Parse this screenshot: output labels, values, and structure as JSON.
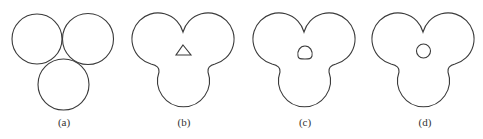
{
  "figure": {
    "stroke_color": "#3a3a3a",
    "background": "#ffffff",
    "panels": [
      {
        "id": "a",
        "label": "(a)",
        "label_x": 64,
        "description": "three separate tangent circles",
        "hole": "none"
      },
      {
        "id": "b",
        "label": "(b)",
        "label_x": 184,
        "description": "merged trefoil outline with triangular hole",
        "hole": "triangle"
      },
      {
        "id": "c",
        "label": "(c)",
        "label_x": 305,
        "description": "merged trefoil outline with rounded-triangle hole",
        "hole": "rounded-triangle"
      },
      {
        "id": "d",
        "label": "(d)",
        "label_x": 425,
        "description": "merged trefoil outline with circular hole",
        "hole": "circle"
      }
    ]
  }
}
